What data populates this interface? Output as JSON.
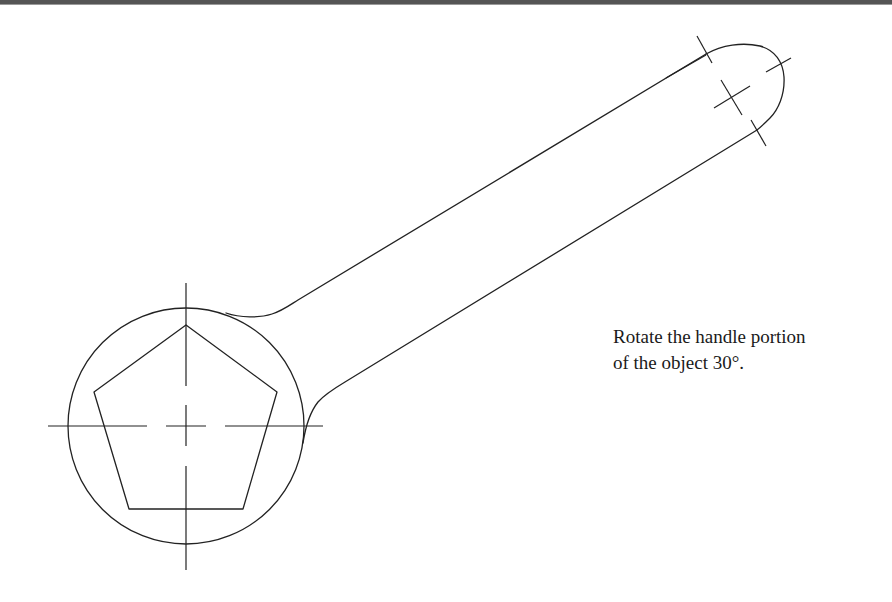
{
  "figure": {
    "type": "cad-drawing",
    "line_color": "#222222",
    "background": "#ffffff",
    "border_color": "#555555"
  },
  "instruction": {
    "line1": "Rotate the handle portion",
    "line2": "of the object 30°."
  },
  "geometry": {
    "head_circle": {
      "cx": 186,
      "cy": 426,
      "r": 118
    },
    "pentagon_points": "186,325 277,392 243,509 129,509 94,392",
    "handle_end_center": {
      "cx": 733,
      "cy": 101
    },
    "handle_rotation_deg": 30
  }
}
